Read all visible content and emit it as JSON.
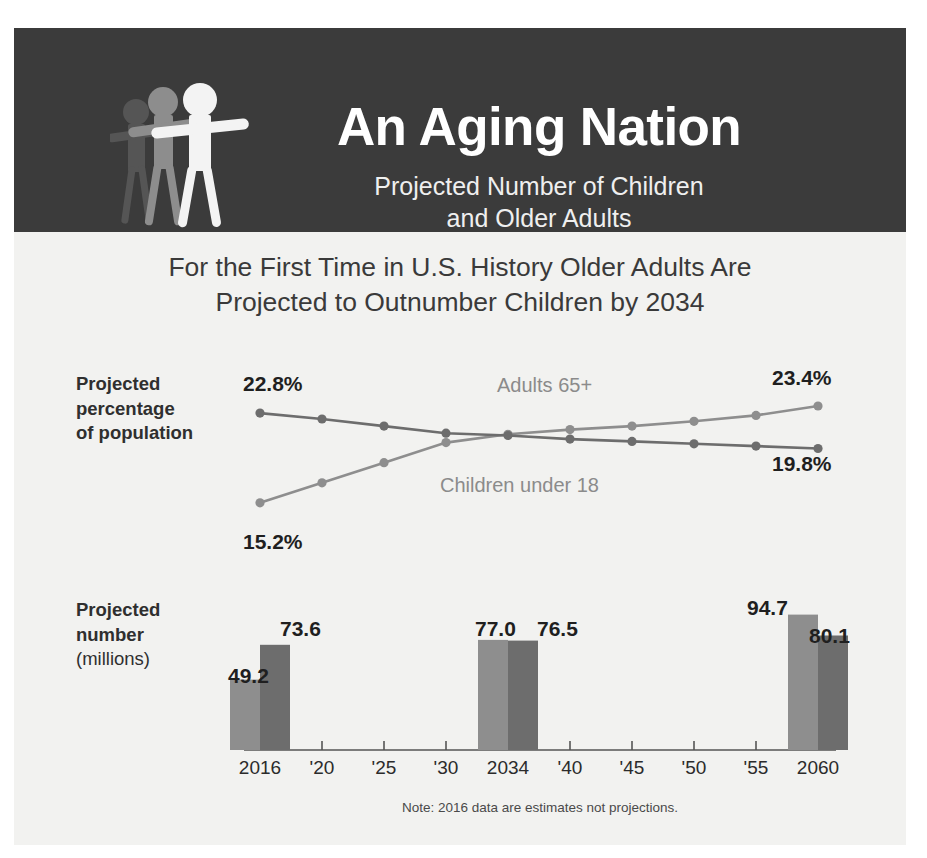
{
  "header": {
    "title": "An Aging Nation",
    "subtitle_line1": "Projected Number of Children",
    "subtitle_line2": "and Older Adults",
    "logo_icon": "three-people-figures-icon",
    "background_color": "#3b3b3b"
  },
  "main": {
    "heading_line1": "For the First Time in U.S. History Older Adults Are",
    "heading_line2": "Projected to Outnumber Children by 2034",
    "note": "Note: 2016 data are estimates not projections."
  },
  "labels": {
    "percentage_line1": "Projected",
    "percentage_line2": "percentage",
    "percentage_line3": "of population",
    "number_line1": "Projected",
    "number_line2": "number",
    "number_line3": "(millions)"
  },
  "colors": {
    "adults_series": "#8e8e8e",
    "children_series": "#6d6d6d",
    "text_dark": "#1f1f1f",
    "series_label_gray": "#8b8b8b"
  },
  "callouts": {
    "children_start": "22.8%",
    "children_end": "19.8%",
    "adults_start": "15.2%",
    "adults_end": "23.4%",
    "adults_legend": "Adults 65+",
    "children_legend": "Children under 18"
  },
  "chart_data": [
    {
      "type": "line",
      "title": "Projected percentage of population",
      "xlabel": "",
      "ylabel": "Projected percentage of population",
      "x": [
        "2016",
        "'20",
        "'25",
        "'30",
        "2034",
        "'40",
        "'45",
        "'50",
        "'55",
        "2060"
      ],
      "ylim": [
        14,
        24.5
      ],
      "grid": false,
      "legend_position": "inline-annotation",
      "series": [
        {
          "name": "Adults 65+",
          "color": "#8e8e8e",
          "values": [
            15.2,
            16.9,
            18.6,
            20.3,
            21.0,
            21.4,
            21.7,
            22.1,
            22.6,
            23.4
          ],
          "start_label": "15.2%",
          "end_label": "23.4%"
        },
        {
          "name": "Children under 18",
          "color": "#6d6d6d",
          "values": [
            22.8,
            22.3,
            21.7,
            21.1,
            20.9,
            20.6,
            20.4,
            20.2,
            20.0,
            19.8
          ],
          "start_label": "22.8%",
          "end_label": "19.8%"
        }
      ],
      "annotations": [
        "Adults 65+ overtake Children under 18 by 2034"
      ]
    },
    {
      "type": "bar",
      "title": "Projected number (millions)",
      "xlabel": "",
      "ylabel": "Projected number (millions)",
      "categories": [
        "2016",
        "'20",
        "'25",
        "'30",
        "2034",
        "'40",
        "'45",
        "'50",
        "'55",
        "2060"
      ],
      "ylim": [
        0,
        100
      ],
      "grid": false,
      "note": "Note: 2016 data are estimates not projections.",
      "series": [
        {
          "name": "Adults 65+",
          "color": "#8e8e8e",
          "categories": [
            "2016",
            "2034",
            "2060"
          ],
          "values": [
            49.2,
            77.0,
            94.7
          ],
          "labels": [
            "49.2",
            "77.0",
            "94.7"
          ]
        },
        {
          "name": "Children under 18",
          "color": "#6d6d6d",
          "categories": [
            "2016",
            "2034",
            "2060"
          ],
          "values": [
            73.6,
            76.5,
            80.1
          ],
          "labels": [
            "73.6",
            "76.5",
            "80.1"
          ]
        }
      ]
    }
  ],
  "axis": {
    "ticks": [
      "2016",
      "'20",
      "'25",
      "'30",
      "2034",
      "'40",
      "'45",
      "'50",
      "'55",
      "2060"
    ]
  }
}
